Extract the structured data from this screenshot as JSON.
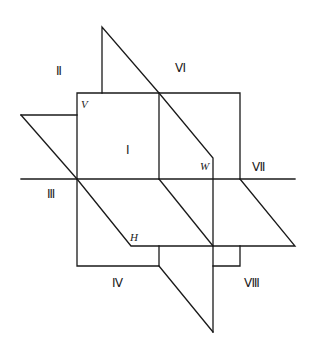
{
  "diagram": {
    "planes": {
      "V": "V",
      "H": "H",
      "W": "W"
    },
    "octants": {
      "I": "Ⅰ",
      "II": "Ⅱ",
      "III": "Ⅲ",
      "IV": "Ⅳ",
      "VI": "Ⅵ",
      "VII": "Ⅶ",
      "VIII": "Ⅷ"
    },
    "colors": {
      "line": "#1a1a1a",
      "background": "#ffffff"
    }
  }
}
